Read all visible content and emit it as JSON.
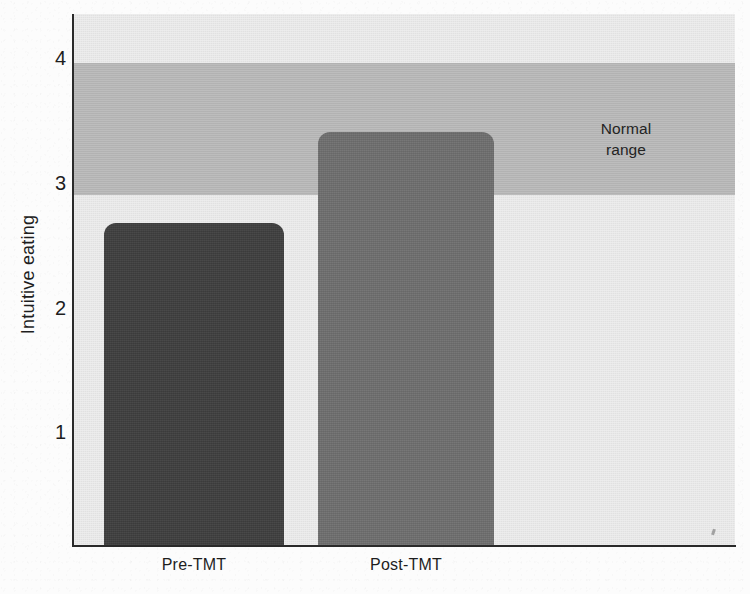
{
  "chart_data": {
    "type": "bar",
    "title": "",
    "subtitle": "",
    "xlabel": "",
    "ylabel": "Intuitive eating",
    "categories": [
      "Pre-TMT",
      "Post-TMT"
    ],
    "values": [
      2.67,
      3.4
    ],
    "series": [
      {
        "name": "Intuitive eating",
        "values": [
          2.67,
          3.4
        ]
      }
    ],
    "ylim": [
      0.09,
      4.35
    ],
    "yticks": [
      1,
      2,
      3,
      4
    ],
    "ytick_labels": [
      "1",
      "2",
      "3",
      "4"
    ],
    "grid": false,
    "legend": "none",
    "annotations": [
      {
        "name": "normal-range",
        "label": "Normal\nrange",
        "label_line1": "Normal",
        "label_line2": "range",
        "type": "hband",
        "y_start": 2.9,
        "y_end": 3.96,
        "color": "#b5b5b5"
      }
    ],
    "bar_colors": [
      "#3f3f3f",
      "#6f6f6f"
    ],
    "plot_background": "#e5e5e5",
    "axis_color": "#2a2a2a"
  },
  "axis": {
    "y_title": "Intuitive eating",
    "y_ticks": [
      {
        "label": "4",
        "value": 4
      },
      {
        "label": "3",
        "value": 3
      },
      {
        "label": "2",
        "value": 2
      },
      {
        "label": "1",
        "value": 1
      }
    ],
    "x_ticks": [
      {
        "label": "Pre-TMT"
      },
      {
        "label": "Post-TMT"
      }
    ]
  },
  "band": {
    "line1": "Normal",
    "line2": "range"
  },
  "colors": {
    "bar_pre": "#3f3f3f",
    "bar_post": "#6f6f6f",
    "band": "#b5b5b5",
    "plot_bg": "#e5e5e5",
    "axis": "#2a2a2a",
    "page_bg": "#fbfbfb"
  }
}
